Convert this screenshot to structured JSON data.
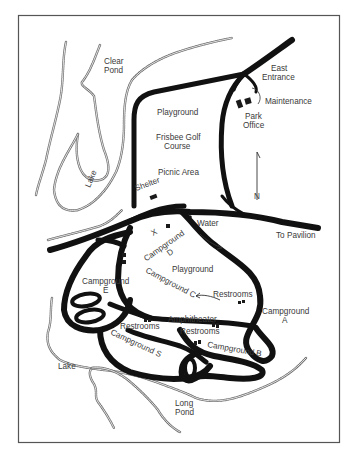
{
  "map": {
    "frame": {
      "stroke": "#555555"
    },
    "labels": {
      "clear_pond": [
        "Clear",
        "Pond"
      ],
      "east_entrance": [
        "East",
        "Entrance"
      ],
      "maintenance": "Maintenance",
      "park_office": [
        "Park",
        "Office"
      ],
      "playground_north": "Playground",
      "frisbee_golf": [
        "Frisbee Golf",
        "Course"
      ],
      "picnic_area": "Picnic Area",
      "shelter": "Shelter",
      "lake_north": "Lake",
      "north_arrow": "N",
      "water": "Water",
      "to_pavilion": "To Pavilion",
      "x_mark": "X",
      "campground_d": [
        "Campground",
        "D"
      ],
      "playground_south": "Playground",
      "campground_c": "Campground C",
      "restrooms_east": "Restrooms",
      "campground_e": [
        "Campground",
        "E"
      ],
      "restrooms_west": "Restrooms",
      "amphitheater": "Amphitheater",
      "restrooms_center": "Restrooms",
      "campground_a": [
        "Campground",
        "A"
      ],
      "campground_s": "Campground S",
      "campground_b": "Campground B",
      "lake_south": "Lake",
      "long_pond": [
        "Long",
        "Pond"
      ]
    }
  }
}
